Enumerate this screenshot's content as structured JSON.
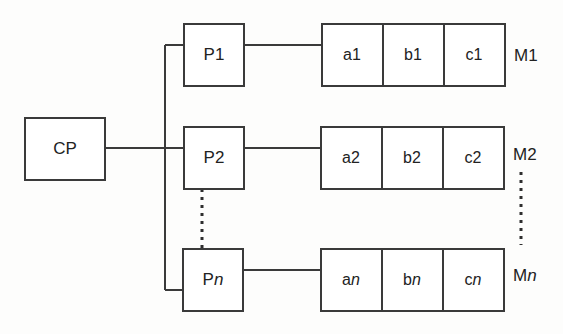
{
  "diagram": {
    "type": "block-diagram",
    "title": "",
    "colors": {
      "stroke": "#3a3a3a",
      "text": "#222222",
      "background": "#fdfdfc",
      "fill": "#ffffff"
    },
    "controller": {
      "id": "cp",
      "label": "CP"
    },
    "processors": [
      {
        "id": "p1",
        "label_prefix": "P",
        "label_suffix": "1",
        "suffix_italic": false
      },
      {
        "id": "p2",
        "label_prefix": "P",
        "label_suffix": "2",
        "suffix_italic": false
      },
      {
        "id": "pn",
        "label_prefix": "P",
        "label_suffix": "n",
        "suffix_italic": true
      }
    ],
    "memories": [
      {
        "id": "m1",
        "row_label_prefix": "M",
        "row_label_suffix": "1",
        "suffix_italic": false,
        "cells": [
          {
            "prefix": "a",
            "suffix": "1",
            "suffix_italic": false
          },
          {
            "prefix": "b",
            "suffix": "1",
            "suffix_italic": false
          },
          {
            "prefix": "c",
            "suffix": "1",
            "suffix_italic": false
          }
        ]
      },
      {
        "id": "m2",
        "row_label_prefix": "M",
        "row_label_suffix": "2",
        "suffix_italic": false,
        "cells": [
          {
            "prefix": "a",
            "suffix": "2",
            "suffix_italic": false
          },
          {
            "prefix": "b",
            "suffix": "2",
            "suffix_italic": false
          },
          {
            "prefix": "c",
            "suffix": "2",
            "suffix_italic": false
          }
        ]
      },
      {
        "id": "mn",
        "row_label_prefix": "M",
        "row_label_suffix": "n",
        "suffix_italic": true,
        "cells": [
          {
            "prefix": "a",
            "suffix": "n",
            "suffix_italic": true
          },
          {
            "prefix": "b",
            "suffix": "n",
            "suffix_italic": true
          },
          {
            "prefix": "c",
            "suffix": "n",
            "suffix_italic": true
          }
        ]
      }
    ],
    "ellipses": [
      {
        "id": "processor-ellipsis",
        "orientation": "vertical",
        "between": "P2 and Pn"
      },
      {
        "id": "memory-ellipsis",
        "orientation": "vertical",
        "between": "M2 and Mn"
      }
    ]
  }
}
